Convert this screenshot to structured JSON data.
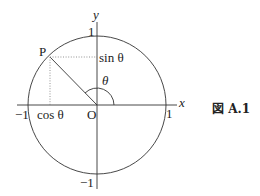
{
  "figure": {
    "caption": "図 A.1",
    "labels": {
      "y_axis": "y",
      "x_axis": "x",
      "origin": "O",
      "point": "P",
      "y_pos_one": "1",
      "y_neg_one": "−1",
      "x_pos_one": "1",
      "x_neg_one": "−1",
      "sin": "sin θ",
      "cos": "cos θ",
      "theta": "θ"
    },
    "geometry": {
      "center": [
        97,
        105
      ],
      "radius": 69,
      "point_p": [
        50,
        57
      ],
      "angle_arc_radius": 17
    },
    "colors": {
      "stroke": "#333333",
      "dotted": "#777777"
    }
  }
}
